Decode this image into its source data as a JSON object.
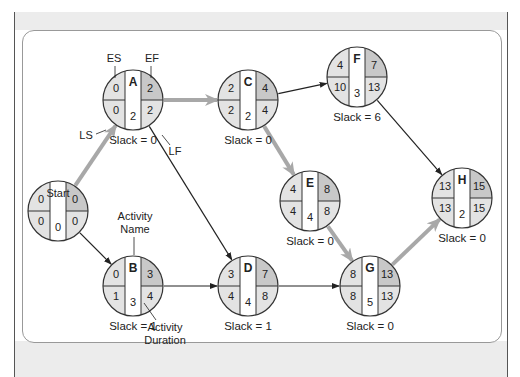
{
  "colors": {
    "light_shade": "#e3e3e3",
    "dark_shade": "#c8c8c8",
    "critical_arrow": "#a8a8a8",
    "arrow": "#222222"
  },
  "nodes": [
    {
      "id": "start",
      "name": "Start",
      "es": "0",
      "ef": "0",
      "ls": "0",
      "lf": "0",
      "duration": "0",
      "slack": ""
    },
    {
      "id": "a",
      "name": "A",
      "es": "0",
      "ef": "2",
      "ls": "0",
      "lf": "2",
      "duration": "2",
      "slack": "Slack = 0"
    },
    {
      "id": "b",
      "name": "B",
      "es": "0",
      "ef": "3",
      "ls": "1",
      "lf": "4",
      "duration": "3",
      "slack": "Slack = 1"
    },
    {
      "id": "c",
      "name": "C",
      "es": "2",
      "ef": "4",
      "ls": "2",
      "lf": "4",
      "duration": "2",
      "slack": "Slack = 0"
    },
    {
      "id": "d",
      "name": "D",
      "es": "3",
      "ef": "7",
      "ls": "4",
      "lf": "8",
      "duration": "4",
      "slack": "Slack = 1"
    },
    {
      "id": "e",
      "name": "E",
      "es": "4",
      "ef": "8",
      "ls": "4",
      "lf": "8",
      "duration": "4",
      "slack": "Slack = 0"
    },
    {
      "id": "f",
      "name": "F",
      "es": "4",
      "ef": "7",
      "ls": "10",
      "lf": "13",
      "duration": "3",
      "slack": "Slack = 6"
    },
    {
      "id": "g",
      "name": "G",
      "es": "8",
      "ef": "13",
      "ls": "8",
      "lf": "13",
      "duration": "5",
      "slack": "Slack = 0"
    },
    {
      "id": "h",
      "name": "H",
      "es": "13",
      "ef": "15",
      "ls": "13",
      "lf": "15",
      "duration": "2",
      "slack": "Slack = 0"
    }
  ],
  "edges": [
    {
      "from": "start",
      "to": "a",
      "critical": true
    },
    {
      "from": "start",
      "to": "b",
      "critical": false
    },
    {
      "from": "a",
      "to": "c",
      "critical": true
    },
    {
      "from": "a",
      "to": "d",
      "critical": false
    },
    {
      "from": "b",
      "to": "d",
      "critical": false
    },
    {
      "from": "c",
      "to": "f",
      "critical": false
    },
    {
      "from": "c",
      "to": "e",
      "critical": true
    },
    {
      "from": "d",
      "to": "g",
      "critical": false
    },
    {
      "from": "e",
      "to": "g",
      "critical": true
    },
    {
      "from": "f",
      "to": "h",
      "critical": false
    },
    {
      "from": "g",
      "to": "h",
      "critical": true
    }
  ],
  "legend": {
    "es": "ES",
    "ef": "EF",
    "ls": "LS",
    "lf": "LF",
    "activity_name": [
      "Activity",
      "Name"
    ],
    "activity_duration": [
      "Activity",
      "Duration"
    ]
  }
}
